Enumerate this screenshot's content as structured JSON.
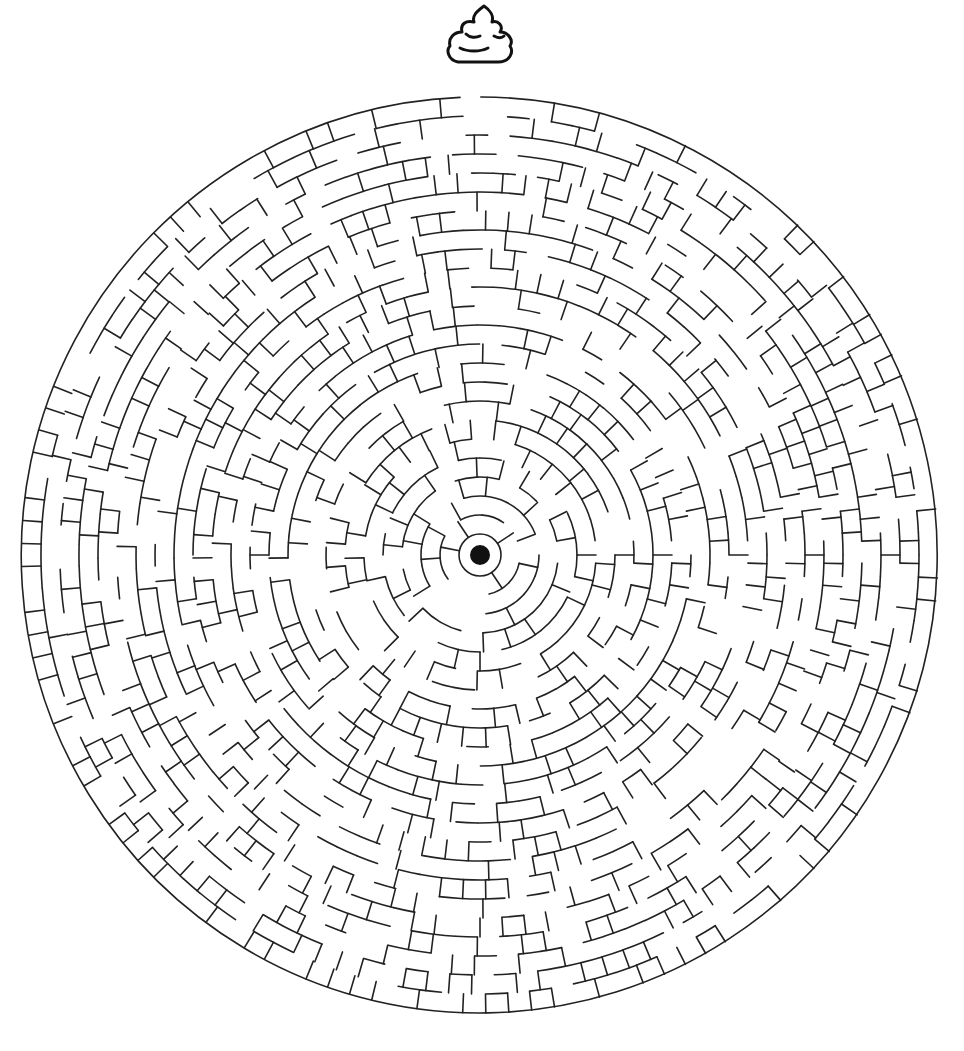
{
  "puzzle": {
    "title": "Circular Maze",
    "goal_icon": "poop-icon",
    "start_marker": "center-dot",
    "entrance_position": "top"
  },
  "maze": {
    "center_x": 480,
    "center_y": 555,
    "outer_radius": 458,
    "inner_ring_radius": 17,
    "center_dot_radius": 10,
    "ring_spacing": 19.3,
    "ring_count": 23,
    "opening_angle_start_deg": -92.5,
    "opening_angle_end_deg": -89.9,
    "wall_color": "#222222",
    "dot_color": "#111111",
    "background_color": "#ffffff",
    "wall_width": 1.6,
    "seed": 7
  }
}
